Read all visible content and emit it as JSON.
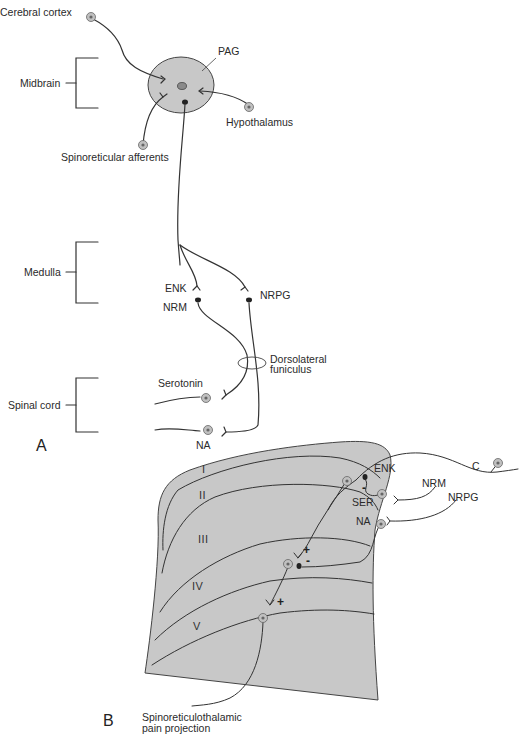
{
  "panel_a": {
    "letter": "A",
    "regions": [
      {
        "label": "Midbrain"
      },
      {
        "label": "Medulla"
      },
      {
        "label": "Spinal cord"
      }
    ],
    "labels": {
      "cerebral_cortex": "Cerebral cortex",
      "pag": "PAG",
      "hypothalamus": "Hypothalamus",
      "spinoreticular": "Spinoreticular afferents",
      "enk": "ENK",
      "nrm": "NRM",
      "nrpg": "NRPG",
      "dorsolateral_line1": "Dorsolateral",
      "dorsolateral_line2": "funiculus",
      "serotonin": "Serotonin",
      "na": "NA"
    }
  },
  "panel_b": {
    "letter": "B",
    "laminae": [
      "I",
      "II",
      "III",
      "IV",
      "V"
    ],
    "labels": {
      "enk": "ENK",
      "ser": "SER",
      "na": "NA",
      "nrm": "NRM",
      "nrpg": "NRPG",
      "c": "C",
      "projection_line1": "Spinoreticulothalamic",
      "projection_line2": "pain projection"
    },
    "signs": {
      "minus_top": "-",
      "plus_mid": "+",
      "minus_mid": "-",
      "plus_low": "+"
    }
  },
  "colors": {
    "fill_gray": "#c8c8c8",
    "line": "#333333",
    "cell_fill": "#b5b5b5"
  }
}
